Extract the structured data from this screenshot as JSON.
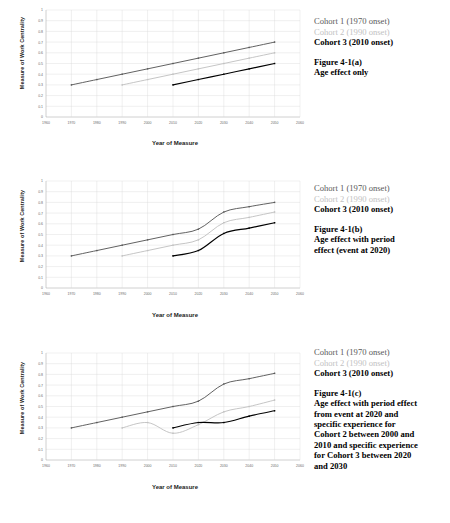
{
  "page": {
    "axis_label_y": "Measure of Work Centrality",
    "axis_label_x": "Year of Measure"
  },
  "legend": {
    "cohort1": "Cohort 1 (1970 onset)",
    "cohort2": "Cohort 2 (1990 onset)",
    "cohort3": "Cohort 3 (2010 onset)"
  },
  "captions": {
    "a": [
      "Figure 4-1(a)",
      "Age effect only"
    ],
    "b": [
      "Figure 4-1(b)",
      "Age effect with period",
      "effect (event at 2020)"
    ],
    "c": [
      "Figure 4-1(c)",
      "Age effect with period effect",
      "from event at 2020 and",
      "specific experience for",
      "Cohort 2 between 2000 and",
      "2010 and specific experience",
      "for Cohort 3 between 2020",
      "and 2030"
    ]
  },
  "colors": {
    "cohort1": "#595959",
    "cohort2": "#c2c2c2",
    "cohort3": "#000000",
    "grid": "#d9d9d9",
    "axis": "#a8a8a8"
  },
  "chart_data": [
    {
      "type": "line",
      "title": "Figure 4-1(a) Age effect only",
      "xlabel": "Year of Measure",
      "ylabel": "Measure of Work Centrality",
      "xlim": [
        1960,
        2060
      ],
      "ylim": [
        0,
        1
      ],
      "xticks": [
        1960,
        1970,
        1980,
        1990,
        2000,
        2010,
        2020,
        2030,
        2040,
        2050,
        2060
      ],
      "yticks": [
        0,
        0.1,
        0.2,
        0.3,
        0.4,
        0.5,
        0.6,
        0.7,
        0.8,
        0.9,
        1
      ],
      "grid": true,
      "legend": "right",
      "series": [
        {
          "name": "Cohort 1 (1970 onset)",
          "color": "#595959",
          "x": [
            1970,
            1980,
            1990,
            2000,
            2010,
            2020,
            2030,
            2040,
            2050
          ],
          "values": [
            0.3,
            0.35,
            0.4,
            0.45,
            0.5,
            0.55,
            0.6,
            0.65,
            0.7
          ]
        },
        {
          "name": "Cohort 2 (1990 onset)",
          "color": "#c2c2c2",
          "x": [
            1990,
            2000,
            2010,
            2020,
            2030,
            2040,
            2050
          ],
          "values": [
            0.3,
            0.35,
            0.4,
            0.45,
            0.5,
            0.55,
            0.6
          ]
        },
        {
          "name": "Cohort 3 (2010 onset)",
          "color": "#000000",
          "x": [
            2010,
            2020,
            2030,
            2040,
            2050
          ],
          "values": [
            0.3,
            0.35,
            0.4,
            0.45,
            0.5
          ]
        }
      ]
    },
    {
      "type": "line",
      "title": "Figure 4-1(b) Age effect with period effect (event at 2020)",
      "xlabel": "Year of Measure",
      "ylabel": "Measure of Work Centrality",
      "xlim": [
        1960,
        2060
      ],
      "ylim": [
        0,
        1
      ],
      "xticks": [
        1960,
        1970,
        1980,
        1990,
        2000,
        2010,
        2020,
        2030,
        2040,
        2050,
        2060
      ],
      "yticks": [
        0,
        0.1,
        0.2,
        0.3,
        0.4,
        0.5,
        0.6,
        0.7,
        0.8,
        0.9,
        1
      ],
      "grid": true,
      "legend": "right",
      "annotations": [
        "period event at 2020"
      ],
      "series": [
        {
          "name": "Cohort 1 (1970 onset)",
          "color": "#595959",
          "x": [
            1970,
            1980,
            1990,
            2000,
            2010,
            2020,
            2030,
            2040,
            2050
          ],
          "values": [
            0.3,
            0.35,
            0.4,
            0.45,
            0.5,
            0.55,
            0.71,
            0.76,
            0.8
          ]
        },
        {
          "name": "Cohort 2 (1990 onset)",
          "color": "#c2c2c2",
          "x": [
            1990,
            2000,
            2010,
            2020,
            2030,
            2040,
            2050
          ],
          "values": [
            0.3,
            0.35,
            0.4,
            0.45,
            0.61,
            0.66,
            0.71
          ]
        },
        {
          "name": "Cohort 3 (2010 onset)",
          "color": "#000000",
          "x": [
            2010,
            2020,
            2030,
            2040,
            2050
          ],
          "values": [
            0.3,
            0.35,
            0.51,
            0.56,
            0.61
          ]
        }
      ]
    },
    {
      "type": "line",
      "title": "Figure 4-1(c) Age effect with period effect from event at 2020 and specific experience for Cohort 2 between 2000 and 2010 and specific experience for Cohort 3 between 2020 and 2030",
      "xlabel": "Year of Measure",
      "ylabel": "Measure of Work Centrality",
      "xlim": [
        1960,
        2060
      ],
      "ylim": [
        0,
        1
      ],
      "xticks": [
        1960,
        1970,
        1980,
        1990,
        2000,
        2010,
        2020,
        2030,
        2040,
        2050,
        2060
      ],
      "yticks": [
        0,
        0.1,
        0.2,
        0.3,
        0.4,
        0.5,
        0.6,
        0.7,
        0.8,
        0.9,
        1
      ],
      "grid": true,
      "legend": "right",
      "annotations": [
        "cohort 2 specific experience 2000-2010",
        "cohort 3 specific experience 2020-2030"
      ],
      "series": [
        {
          "name": "Cohort 1 (1970 onset)",
          "color": "#595959",
          "x": [
            1970,
            1980,
            1990,
            2000,
            2010,
            2020,
            2030,
            2040,
            2050
          ],
          "values": [
            0.3,
            0.35,
            0.4,
            0.45,
            0.5,
            0.55,
            0.71,
            0.76,
            0.81
          ]
        },
        {
          "name": "Cohort 2 (1990 onset)",
          "color": "#c2c2c2",
          "x": [
            1990,
            2000,
            2010,
            2020,
            2030,
            2040,
            2050
          ],
          "values": [
            0.3,
            0.35,
            0.25,
            0.33,
            0.45,
            0.5,
            0.56
          ]
        },
        {
          "name": "Cohort 3 (2010 onset)",
          "color": "#000000",
          "x": [
            2010,
            2020,
            2030,
            2040,
            2050
          ],
          "values": [
            0.3,
            0.35,
            0.35,
            0.41,
            0.46
          ]
        }
      ]
    }
  ]
}
